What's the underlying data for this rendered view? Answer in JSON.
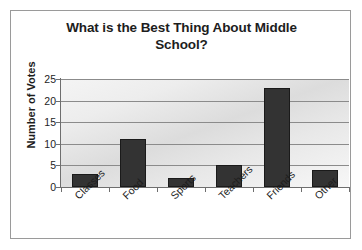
{
  "chart_data": {
    "type": "bar",
    "title": "What is the Best Thing About Middle School?",
    "title_lines": [
      "What is the Best Thing About Middle",
      "School?"
    ],
    "xlabel": "",
    "ylabel": "Number of Votes",
    "categories": [
      "Classes",
      "Food",
      "Sports",
      "Teachers",
      "Friends",
      "Other"
    ],
    "values": [
      3,
      11,
      2,
      5,
      23,
      4
    ],
    "ylim": [
      0,
      25
    ],
    "yticks": [
      0,
      5,
      10,
      15,
      20,
      25
    ],
    "ytick_labels": [
      "0",
      "5",
      "10",
      "15",
      "20",
      "25"
    ],
    "grid": true,
    "grid_axis": "y",
    "legend": false,
    "bar_color": "#333333",
    "plot_background": "#e8e8e8",
    "frame_border_color": "#9a9a9a",
    "text_color": "#1d1d1d"
  }
}
